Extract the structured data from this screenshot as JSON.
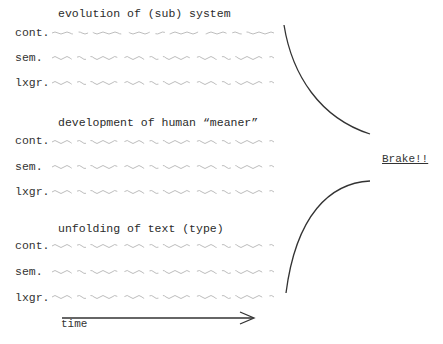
{
  "sections": [
    {
      "title": "evolution of (sub) system",
      "rows": [
        {
          "label": "cont."
        },
        {
          "label": "sem."
        },
        {
          "label": "lxgr."
        }
      ]
    },
    {
      "title": "development of human “meaner”",
      "rows": [
        {
          "label": "cont."
        },
        {
          "label": "sem."
        },
        {
          "label": "lxgr."
        }
      ]
    },
    {
      "title": "unfolding of text (type)",
      "rows": [
        {
          "label": "cont."
        },
        {
          "label": "sem."
        },
        {
          "label": "lxgr."
        }
      ]
    }
  ],
  "axis": {
    "label": "time"
  },
  "annotation": {
    "label": "Brake!!"
  },
  "colors": {
    "ink": "#333333",
    "wave": "#b8b8b8"
  }
}
